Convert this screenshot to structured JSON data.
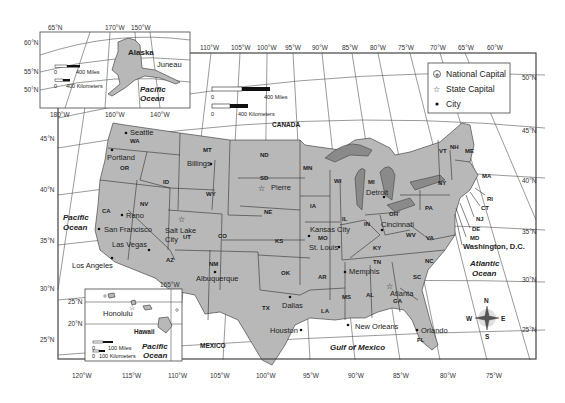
{
  "map": {
    "title": "United States",
    "legend": {
      "items": [
        {
          "icon": "national-capital-icon",
          "label": "National Capital"
        },
        {
          "icon": "state-capital-icon",
          "label": "State Capital"
        },
        {
          "icon": "city-dot-icon",
          "label": "City"
        }
      ]
    },
    "scale_main": {
      "miles_zero": "0",
      "miles_label": "400 Miles",
      "km_zero": "0",
      "km_label": "400 Kilometers"
    },
    "scale_alaska": {
      "miles_zero": "0",
      "miles_label": "400 Miles",
      "km_zero": "0",
      "km_label": "400 Kilometers"
    },
    "scale_hawaii": {
      "miles_zero": "0",
      "miles_label": "100 Miles",
      "km_zero": "0",
      "km_label": "100 Kilometers"
    },
    "top_longitudes": [
      "110°W",
      "105°W",
      "100°W",
      "95°W",
      "90°W",
      "85°W",
      "80°W",
      "75°W",
      "70°W",
      "65°W",
      "60°W"
    ],
    "bottom_longitudes": [
      "120°W",
      "115°W",
      "110°W",
      "105°W",
      "100°W",
      "95°W",
      "90°W",
      "85°W",
      "80°W",
      "75°W"
    ],
    "left_latitudes": [
      "45°N",
      "40°N",
      "35°N",
      "30°N",
      "25°N"
    ],
    "right_latitudes": [
      "50°N",
      "45°N",
      "40°N",
      "35°N",
      "30°N",
      "25°N"
    ],
    "alaska_inset": {
      "name": "Alaska",
      "city": "Juneau",
      "ocean": "Pacific Ocean",
      "top_ticks": [
        "65°N",
        "170°W",
        "150°W"
      ],
      "left_ticks": [
        "60°N",
        "55°N",
        "50°N"
      ],
      "bottom_ticks": [
        "180°W",
        "160°W",
        "140°W"
      ]
    },
    "hawaii_inset": {
      "name": "Hawaii",
      "city": "Honolulu",
      "ocean": "Pacific Ocean",
      "top_ticks": [
        "165°W"
      ],
      "left_ticks": [
        "25°N",
        "20°N"
      ]
    },
    "regions": {
      "canada": "CANADA",
      "mexico": "MEXICO",
      "pacific": "Pacific Ocean",
      "atlantic": "Atlantic Ocean",
      "gulf": "Gulf of Mexico"
    },
    "states": [
      "WA",
      "OR",
      "CA",
      "ID",
      "NV",
      "MT",
      "WY",
      "UT",
      "AZ",
      "CO",
      "NM",
      "ND",
      "SD",
      "NE",
      "KS",
      "OK",
      "TX",
      "MN",
      "IA",
      "MO",
      "AR",
      "LA",
      "WI",
      "IL",
      "MS",
      "MI",
      "IN",
      "KY",
      "TN",
      "AL",
      "OH",
      "GA",
      "FL",
      "SC",
      "NC",
      "VA",
      "WV",
      "PA",
      "NY",
      "VT",
      "NH",
      "ME",
      "MA",
      "RI",
      "CT",
      "NJ",
      "DE",
      "MD"
    ],
    "cities": [
      "Seattle",
      "Portland",
      "Billings",
      "Reno",
      "San Francisco",
      "Salt Lake City",
      "Las Vegas",
      "Los Angeles",
      "Albuquerque",
      "Pierre",
      "Kansas City",
      "St. Louis",
      "Memphis",
      "Dallas",
      "Houston",
      "New Orleans",
      "Atlanta",
      "Orlando",
      "Detroit",
      "Cincinnati",
      "Washington, D.C."
    ],
    "compass": {
      "n": "N",
      "s": "S",
      "e": "E",
      "w": "W"
    }
  }
}
